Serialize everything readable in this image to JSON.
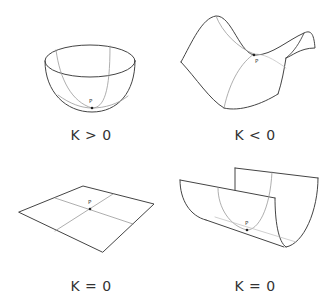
{
  "panels": [
    {
      "id": "sphere",
      "surface": "bowl",
      "label": "K > 0",
      "point": "P"
    },
    {
      "id": "saddle",
      "surface": "saddle",
      "label": "K < 0",
      "point": "P"
    },
    {
      "id": "plane",
      "surface": "plane",
      "label": "K = 0",
      "point": "P"
    },
    {
      "id": "cylinder",
      "surface": "half-cylinder",
      "label": "K = 0",
      "point": "P"
    }
  ],
  "colors": {
    "outline": "#444444",
    "curve": "#9a9a9a",
    "point": "#222222",
    "text": "#333333"
  }
}
